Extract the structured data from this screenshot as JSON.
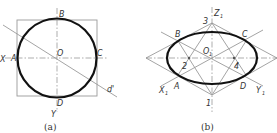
{
  "figure": {
    "panel_a": {
      "caption": "(a)",
      "labels": {
        "A": "A",
        "B": "B",
        "C": "C",
        "D": "D",
        "O": "O",
        "X": "X",
        "Y": "Y",
        "d": "d'"
      }
    },
    "panel_b": {
      "caption": "(b)",
      "labels": {
        "A": "A",
        "B": "B",
        "C": "C",
        "D": "D",
        "O1": "O",
        "O1_sub": "1",
        "X1": "X",
        "X1_sub": "1",
        "Y1": "Y",
        "Y1_sub": "1",
        "Z1": "Z",
        "Z1_sub": "1",
        "p1": "1",
        "p2": "2",
        "p3": "3",
        "p4": "4"
      }
    },
    "colors": {
      "outline": "#111111",
      "construction": "#9a9a9a",
      "text": "#333333"
    }
  }
}
